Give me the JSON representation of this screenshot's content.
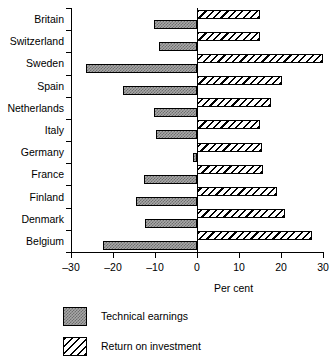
{
  "chart_data": {
    "type": "bar",
    "orientation": "horizontal",
    "title": "",
    "xlabel": "Per cent",
    "ylabel": "",
    "xlim": [
      -30,
      30
    ],
    "xticks": [
      -30,
      -20,
      -10,
      0,
      10,
      20,
      30
    ],
    "xticklabels": [
      "–30",
      "–20",
      "–10",
      "0",
      "10",
      "20",
      "30"
    ],
    "grid": false,
    "legend_position": "below-axes",
    "categories": [
      "Britain",
      "Switzerland",
      "Sweden",
      "Spain",
      "Netherlands",
      "Italy",
      "Germany",
      "France",
      "Finland",
      "Denmark",
      "Belgium"
    ],
    "series": [
      {
        "name": "Technical earnings",
        "pattern": "dotted",
        "values": [
          -10.2,
          -9.0,
          -26.4,
          -17.6,
          -10.2,
          -9.8,
          -1.0,
          -12.6,
          -14.6,
          -12.4,
          -22.4
        ]
      },
      {
        "name": "Return on investment",
        "pattern": "hatched",
        "values": [
          15.0,
          15.0,
          30.0,
          20.2,
          17.6,
          15.0,
          15.5,
          15.7,
          19.0,
          21.0,
          27.4
        ]
      }
    ]
  },
  "legend": {
    "items": [
      {
        "label": "Technical earnings",
        "pattern": "dotted"
      },
      {
        "label": "Return on investment",
        "pattern": "hatched"
      }
    ]
  }
}
